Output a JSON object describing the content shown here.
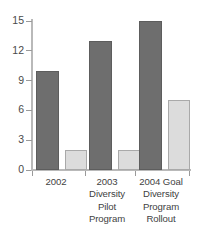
{
  "chart_data": {
    "type": "bar",
    "title": "",
    "subtitle": "",
    "xlabel": "",
    "ylabel": "",
    "ylim": [
      0,
      15
    ],
    "yticks": [
      0,
      3,
      6,
      9,
      12,
      15
    ],
    "grid": false,
    "legend": "none",
    "categories": [
      "2002",
      "2003 Diversity Pilot Program",
      "2004 Goal Diversity Program Rollout"
    ],
    "category_lines": [
      [
        "2002"
      ],
      [
        "2003",
        "Diversity",
        "Pilot",
        "Program"
      ],
      [
        "2004 Goal",
        "Diversity",
        "Program",
        "Rollout"
      ]
    ],
    "series": [
      {
        "name": "Series 1",
        "color": "#6e6e6e",
        "values": [
          10,
          13,
          15
        ]
      },
      {
        "name": "Series 2",
        "color": "#dcdcdc",
        "values": [
          2,
          2,
          7
        ]
      }
    ]
  },
  "axis": {
    "tick_labels": [
      "15",
      "12",
      "9",
      "6",
      "3",
      "0"
    ]
  }
}
